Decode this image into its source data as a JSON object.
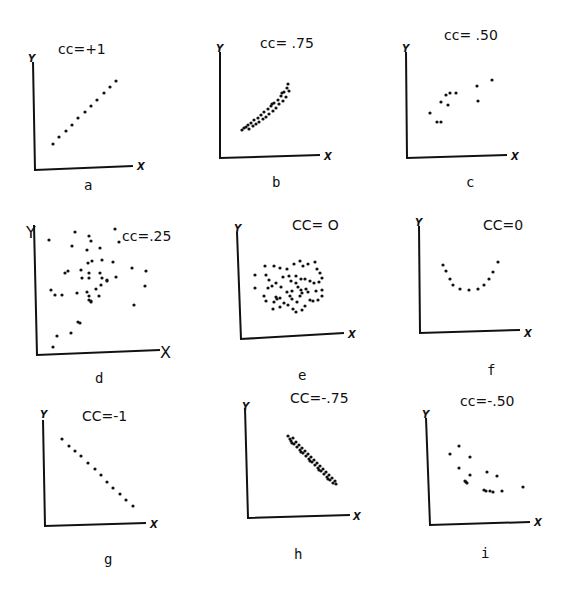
{
  "chart_data": [
    {
      "type": "scatter",
      "panel": "a",
      "title": "cc=+1",
      "xlabel": "X",
      "ylabel": "Y",
      "origin": [
        35,
        170
      ],
      "ytop": [
        33,
        62
      ],
      "xend": [
        133,
        166
      ],
      "title_pos": [
        58,
        54
      ],
      "label_pos": [
        84,
        190
      ],
      "ylab_pos": [
        28,
        62
      ],
      "xlab_pos": [
        137,
        170
      ],
      "points": [
        [
          53,
          144
        ],
        [
          59,
          137
        ],
        [
          66,
          131
        ],
        [
          72,
          125
        ],
        [
          78,
          118
        ],
        [
          85,
          112
        ],
        [
          91,
          106
        ],
        [
          97,
          100
        ],
        [
          104,
          93
        ],
        [
          110,
          87
        ],
        [
          116,
          81
        ]
      ]
    },
    {
      "type": "scatter",
      "panel": "b",
      "title": "cc= .75",
      "xlabel": "X",
      "ylabel": "Y",
      "origin": [
        220,
        158
      ],
      "ytop": [
        220,
        52
      ],
      "xend": [
        320,
        155
      ],
      "title_pos": [
        260,
        48
      ],
      "label_pos": [
        272,
        187
      ],
      "ylab_pos": [
        216,
        52
      ],
      "xlab_pos": [
        324,
        160
      ],
      "points": [
        [
          242,
          130
        ],
        [
          244,
          128
        ],
        [
          246,
          127
        ],
        [
          248,
          125
        ],
        [
          249,
          129
        ],
        [
          251,
          123
        ],
        [
          253,
          126
        ],
        [
          254,
          120
        ],
        [
          256,
          124
        ],
        [
          258,
          118
        ],
        [
          259,
          122
        ],
        [
          261,
          115
        ],
        [
          263,
          119
        ],
        [
          264,
          112
        ],
        [
          266,
          117
        ],
        [
          268,
          109
        ],
        [
          269,
          114
        ],
        [
          271,
          106
        ],
        [
          273,
          111
        ],
        [
          274,
          103
        ],
        [
          276,
          108
        ],
        [
          278,
          100
        ],
        [
          279,
          104
        ],
        [
          281,
          96
        ],
        [
          283,
          101
        ],
        [
          284,
          92
        ],
        [
          286,
          97
        ],
        [
          287,
          88
        ],
        [
          288,
          84
        ],
        [
          289,
          91
        ],
        [
          282,
          93
        ],
        [
          272,
          104
        ]
      ]
    },
    {
      "type": "scatter",
      "panel": "c",
      "title": "cc= .50",
      "xlabel": "X",
      "ylabel": "Y",
      "origin": [
        407,
        158
      ],
      "ytop": [
        406,
        52
      ],
      "xend": [
        507,
        155
      ],
      "title_pos": [
        444,
        40
      ],
      "label_pos": [
        466,
        187
      ],
      "ylab_pos": [
        402,
        52
      ],
      "xlab_pos": [
        511,
        160
      ],
      "points": [
        [
          430,
          113
        ],
        [
          437,
          122
        ],
        [
          441,
          122
        ],
        [
          441,
          102
        ],
        [
          446,
          95
        ],
        [
          448,
          105
        ],
        [
          450,
          93
        ],
        [
          456,
          93
        ],
        [
          477,
          86
        ],
        [
          478,
          101
        ],
        [
          492,
          80
        ]
      ]
    },
    {
      "type": "scatter",
      "panel": "d",
      "title": "cc=.25",
      "xlabel": "X",
      "ylabel": "Y",
      "origin": [
        37,
        355
      ],
      "ytop": [
        34,
        225
      ],
      "xend": [
        160,
        350
      ],
      "title_pos": [
        122,
        241
      ],
      "label_pos": [
        95,
        383
      ],
      "ylab_pos": [
        26,
        238
      ],
      "xlab_pos": [
        160,
        358
      ],
      "points": [
        [
          49,
          240
        ],
        [
          75,
          232
        ],
        [
          72,
          246
        ],
        [
          89,
          236
        ],
        [
          91,
          241
        ],
        [
          87,
          250
        ],
        [
          100,
          248
        ],
        [
          115,
          229
        ],
        [
          119,
          242
        ],
        [
          88,
          263
        ],
        [
          102,
          260
        ],
        [
          92,
          261
        ],
        [
          89,
          273
        ],
        [
          113,
          262
        ],
        [
          132,
          268
        ],
        [
          146,
          271
        ],
        [
          145,
          286
        ],
        [
          116,
          277
        ],
        [
          65,
          273
        ],
        [
          68,
          271
        ],
        [
          81,
          270
        ],
        [
          82,
          278
        ],
        [
          100,
          273
        ],
        [
          102,
          278
        ],
        [
          107,
          281
        ],
        [
          89,
          278
        ],
        [
          96,
          289
        ],
        [
          87,
          292
        ],
        [
          51,
          290
        ],
        [
          55,
          295
        ],
        [
          62,
          295
        ],
        [
          77,
          293
        ],
        [
          101,
          285
        ],
        [
          107,
          280
        ],
        [
          134,
          305
        ],
        [
          89,
          296
        ],
        [
          89,
          300
        ],
        [
          91,
          301
        ],
        [
          99,
          296
        ],
        [
          91,
          302
        ],
        [
          78,
          322
        ],
        [
          80,
          323
        ],
        [
          57,
          336
        ],
        [
          71,
          333
        ],
        [
          53,
          347
        ]
      ]
    },
    {
      "type": "scatter",
      "panel": "e",
      "title": "CC= O",
      "xlabel": "X",
      "ylabel": "Y",
      "origin": [
        241,
        339
      ],
      "ytop": [
        237,
        232
      ],
      "xend": [
        344,
        333
      ],
      "title_pos": [
        292,
        230
      ],
      "label_pos": [
        298,
        380
      ],
      "ylab_pos": [
        234,
        232
      ],
      "xlab_pos": [
        348,
        338
      ],
      "points": [
        [
          255,
          275
        ],
        [
          265,
          266
        ],
        [
          274,
          266
        ],
        [
          280,
          268
        ],
        [
          287,
          269
        ],
        [
          294,
          264
        ],
        [
          300,
          261
        ],
        [
          303,
          266
        ],
        [
          308,
          264
        ],
        [
          315,
          262
        ],
        [
          317,
          269
        ],
        [
          320,
          273
        ],
        [
          322,
          278
        ],
        [
          266,
          275
        ],
        [
          269,
          280
        ],
        [
          276,
          283
        ],
        [
          283,
          277
        ],
        [
          289,
          276
        ],
        [
          296,
          276
        ],
        [
          301,
          279
        ],
        [
          305,
          279
        ],
        [
          310,
          281
        ],
        [
          314,
          283
        ],
        [
          319,
          282
        ],
        [
          255,
          288
        ],
        [
          268,
          288
        ],
        [
          272,
          286
        ],
        [
          281,
          287
        ],
        [
          291,
          281
        ],
        [
          296,
          283
        ],
        [
          298,
          287
        ],
        [
          301,
          290
        ],
        [
          306,
          289
        ],
        [
          308,
          292
        ],
        [
          316,
          291
        ],
        [
          322,
          290
        ],
        [
          264,
          296
        ],
        [
          276,
          297
        ],
        [
          280,
          298
        ],
        [
          287,
          292
        ],
        [
          290,
          296
        ],
        [
          292,
          291
        ],
        [
          300,
          296
        ],
        [
          302,
          293
        ],
        [
          310,
          300
        ],
        [
          318,
          300
        ],
        [
          322,
          296
        ],
        [
          266,
          301
        ],
        [
          274,
          302
        ],
        [
          277,
          299
        ],
        [
          284,
          303
        ],
        [
          292,
          299
        ],
        [
          297,
          302
        ],
        [
          305,
          306
        ],
        [
          313,
          301
        ],
        [
          273,
          309
        ],
        [
          280,
          307
        ],
        [
          288,
          305
        ],
        [
          293,
          309
        ],
        [
          296,
          312
        ],
        [
          302,
          310
        ]
      ]
    },
    {
      "type": "scatter",
      "panel": "f",
      "title": "CC=0",
      "xlabel": "X",
      "ylabel": "Y",
      "origin": [
        420,
        333
      ],
      "ytop": [
        419,
        226
      ],
      "xend": [
        520,
        330
      ],
      "title_pos": [
        483,
        230
      ],
      "label_pos": [
        487,
        375
      ],
      "ylab_pos": [
        415,
        226
      ],
      "xlab_pos": [
        524,
        337
      ],
      "points": [
        [
          443,
          265
        ],
        [
          446,
          271
        ],
        [
          450,
          279
        ],
        [
          453,
          285
        ],
        [
          460,
          289
        ],
        [
          469,
          290
        ],
        [
          478,
          289
        ],
        [
          484,
          285
        ],
        [
          489,
          279
        ],
        [
          493,
          272
        ],
        [
          498,
          262
        ]
      ]
    },
    {
      "type": "scatter",
      "panel": "g",
      "title": "CC=-1",
      "xlabel": "X",
      "ylabel": "Y",
      "origin": [
        45,
        526
      ],
      "ytop": [
        43,
        420
      ],
      "xend": [
        146,
        523
      ],
      "title_pos": [
        82,
        421
      ],
      "label_pos": [
        104,
        564
      ],
      "ylab_pos": [
        40,
        418
      ],
      "xlab_pos": [
        150,
        528
      ],
      "points": [
        [
          62,
          439
        ],
        [
          69,
          446
        ],
        [
          75,
          451
        ],
        [
          81,
          456
        ],
        [
          88,
          463
        ],
        [
          95,
          469
        ],
        [
          101,
          475
        ],
        [
          107,
          482
        ],
        [
          113,
          488
        ],
        [
          120,
          494
        ],
        [
          126,
          500
        ],
        [
          133,
          506
        ]
      ]
    },
    {
      "type": "scatter",
      "panel": "h",
      "title": "CC=-.75",
      "xlabel": "X",
      "ylabel": "Y",
      "origin": [
        248,
        518
      ],
      "ytop": [
        245,
        408
      ],
      "xend": [
        350,
        515
      ],
      "title_pos": [
        290,
        403
      ],
      "label_pos": [
        294,
        559
      ],
      "ylab_pos": [
        242,
        410
      ],
      "xlab_pos": [
        353,
        520
      ],
      "points": [
        [
          288,
          436
        ],
        [
          290,
          439
        ],
        [
          291,
          441
        ],
        [
          293,
          438
        ],
        [
          294,
          444
        ],
        [
          296,
          442
        ],
        [
          297,
          447
        ],
        [
          299,
          445
        ],
        [
          300,
          450
        ],
        [
          302,
          448
        ],
        [
          303,
          453
        ],
        [
          305,
          451
        ],
        [
          306,
          456
        ],
        [
          308,
          454
        ],
        [
          309,
          459
        ],
        [
          311,
          457
        ],
        [
          312,
          462
        ],
        [
          314,
          460
        ],
        [
          315,
          465
        ],
        [
          317,
          463
        ],
        [
          318,
          468
        ],
        [
          320,
          466
        ],
        [
          321,
          471
        ],
        [
          323,
          469
        ],
        [
          324,
          474
        ],
        [
          326,
          472
        ],
        [
          327,
          477
        ],
        [
          329,
          475
        ],
        [
          330,
          480
        ],
        [
          332,
          478
        ],
        [
          333,
          483
        ],
        [
          335,
          481
        ],
        [
          336,
          484
        ],
        [
          292,
          443
        ],
        [
          301,
          452
        ],
        [
          310,
          461
        ],
        [
          319,
          470
        ],
        [
          328,
          479
        ]
      ]
    },
    {
      "type": "scatter",
      "panel": "i",
      "title": "cc=-.50",
      "xlabel": "X",
      "ylabel": "Y",
      "origin": [
        430,
        525
      ],
      "ytop": [
        426,
        418
      ],
      "xend": [
        530,
        522
      ],
      "title_pos": [
        460,
        406
      ],
      "label_pos": [
        481,
        558
      ],
      "ylab_pos": [
        422,
        418
      ],
      "xlab_pos": [
        534,
        526
      ],
      "points": [
        [
          450,
          454
        ],
        [
          459,
          446
        ],
        [
          470,
          457
        ],
        [
          459,
          468
        ],
        [
          470,
          475
        ],
        [
          466,
          482
        ],
        [
          465,
          481
        ],
        [
          467,
          483
        ],
        [
          487,
          472
        ],
        [
          497,
          476
        ],
        [
          484,
          490
        ],
        [
          486,
          491
        ],
        [
          490,
          491
        ],
        [
          493,
          492
        ],
        [
          502,
          491
        ],
        [
          523,
          487
        ]
      ]
    }
  ],
  "panel_labels": [
    "a",
    "b",
    "c",
    "d",
    "e",
    "f",
    "g",
    "h",
    "i"
  ]
}
